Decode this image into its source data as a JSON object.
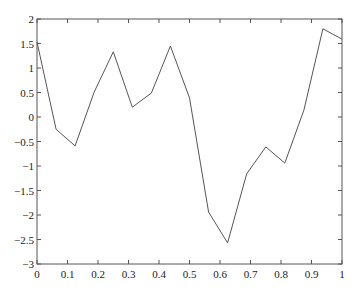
{
  "chart_data": {
    "type": "line",
    "title": "",
    "xlabel": "",
    "ylabel": "",
    "xlim": [
      0,
      1
    ],
    "ylim": [
      -3,
      2
    ],
    "grid": false,
    "legend": null,
    "x_ticks": [
      0,
      0.1,
      0.2,
      0.3,
      0.4,
      0.5,
      0.6,
      0.7,
      0.8,
      0.9,
      1
    ],
    "x_tick_labels": [
      "0",
      "0.1",
      "0.2",
      "0.3",
      "0.4",
      "0.5",
      "0.6",
      "0.7",
      "0.8",
      "0.9",
      "1"
    ],
    "y_ticks": [
      2,
      1.5,
      1,
      0.5,
      0,
      -0.5,
      -1,
      -1.5,
      -2,
      -2.5,
      -3
    ],
    "y_tick_labels": [
      "2",
      "1.5",
      "1",
      "0.5",
      "0",
      "-0.5",
      "-1",
      "-1.5",
      "-2",
      "-2.5",
      "-3"
    ],
    "series": [
      {
        "name": "series1",
        "color": "#555555",
        "x": [
          0,
          0.0625,
          0.125,
          0.1875,
          0.25,
          0.3125,
          0.375,
          0.4375,
          0.5,
          0.5625,
          0.625,
          0.6875,
          0.75,
          0.8125,
          0.875,
          0.9375,
          1
        ],
        "y": [
          1.53,
          -0.25,
          -0.59,
          0.51,
          1.33,
          0.2,
          0.49,
          1.45,
          0.39,
          -1.94,
          -2.57,
          -1.16,
          -0.61,
          -0.94,
          0.14,
          1.8,
          1.59
        ]
      }
    ]
  }
}
